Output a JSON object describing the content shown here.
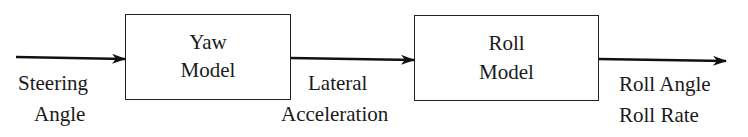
{
  "diagram": {
    "type": "block-diagram",
    "blocks": [
      {
        "id": "yaw",
        "line1": "Yaw",
        "line2": "Model"
      },
      {
        "id": "roll",
        "line1": "Roll",
        "line2": "Model"
      }
    ],
    "signals": {
      "input": {
        "line1": "Steering",
        "line2": "Angle"
      },
      "intermediate": {
        "line1": "Lateral",
        "line2": "Acceleration"
      },
      "output": {
        "line1": "Roll Angle",
        "line2": "Roll Rate"
      }
    },
    "edges": [
      {
        "from": "input",
        "to": "yaw"
      },
      {
        "from": "yaw",
        "to": "roll",
        "label": "Lateral Acceleration"
      },
      {
        "from": "roll",
        "to": "output"
      }
    ]
  }
}
